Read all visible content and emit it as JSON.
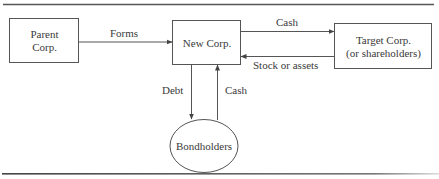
{
  "diagram": {
    "nodes": {
      "parent": {
        "line1": "Parent",
        "line2": "Corp."
      },
      "newcorp": {
        "label": "New Corp."
      },
      "target": {
        "line1": "Target Corp.",
        "line2": "(or shareholders)"
      },
      "bondholders": {
        "label": "Bondholders"
      }
    },
    "edges": {
      "forms": "Forms",
      "cash_to_target": "Cash",
      "stock_or_assets": "Stock or assets",
      "debt": "Debt",
      "cash_from_bondholders": "Cash"
    },
    "colors": {
      "line": "#555555",
      "rule": "#444444",
      "text": "#3a3a3a"
    }
  }
}
